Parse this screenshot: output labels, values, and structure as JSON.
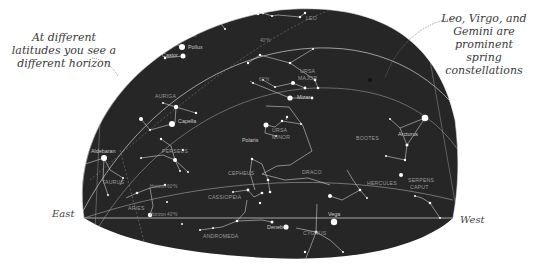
{
  "annotations": {
    "left": [
      "At different",
      "latitudes you see a",
      "different horizon"
    ],
    "right": [
      "Leo, Virgo, and",
      "Gemini are",
      "prominent spring",
      "constellations"
    ]
  },
  "directions": {
    "east": "East",
    "west": "West"
  },
  "latitudes": {
    "lat40": "40°N",
    "lat60": "60°N",
    "horizon40": "Horizon 40°N",
    "horizon60": "Horizon 60°N",
    "horizon_left": "Horizon 20°N"
  },
  "constellations": {
    "leo": "LEO",
    "gemini": "GEMINI",
    "ursa_major": [
      "URSA",
      "MAJOR"
    ],
    "auriga": "AURIGA",
    "ursa_minor": [
      "URSA",
      "MINOR"
    ],
    "bootes": "BOOTES",
    "perseus": "PERSEUS",
    "taurus": "TAURUS",
    "cepheus": "CEPHEUS",
    "draco": "DRACO",
    "hercules": "HERCULES",
    "serpens_caput": [
      "SERPENS",
      "CAPUT"
    ],
    "cassiopeia": "CASSIOPEIA",
    "aries": "ARIES",
    "andromeda": "ANDROMEDA",
    "cygnus": "CYGNUS"
  },
  "stars": {
    "pollux": "Pollux",
    "castor": "Castor",
    "capella": "Capella",
    "polaris": "Polaris",
    "arcturus": "Arcturus",
    "aldebaran": "Aldebaran",
    "vega": "Vega",
    "deneb": "Deneb",
    "mizar": "Mizar"
  },
  "colors": {
    "sky": "#262626",
    "line": "#d0d0d0",
    "star": "#ffffff",
    "label": "#9a9a9a",
    "annotation": "#3a3a3a"
  }
}
